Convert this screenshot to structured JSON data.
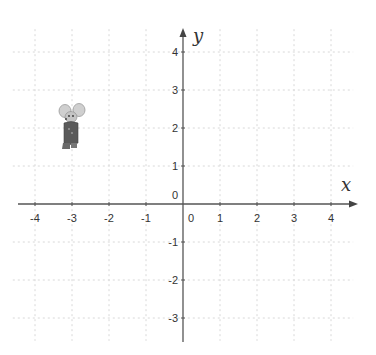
{
  "axes": {
    "x_label": "x",
    "y_label": "y",
    "origin_px": [
      183,
      204
    ],
    "unit_px_x": 37,
    "unit_px_y": 38,
    "x_ticks": [
      "-4",
      "-3",
      "-2",
      "-1",
      "0",
      "1",
      "2",
      "3",
      "4"
    ],
    "x_tick_values": [
      -4,
      -3,
      -2,
      -1,
      0,
      1,
      2,
      3,
      4
    ],
    "y_ticks": [
      "-3",
      "-2",
      "-1",
      "0",
      "1",
      "2",
      "3",
      "4"
    ],
    "y_tick_values": [
      -3,
      -2,
      -1,
      0,
      1,
      2,
      3,
      4
    ],
    "xlim": [
      -4.6,
      4.6
    ],
    "ylim": [
      -3.6,
      4.6
    ],
    "grid": true,
    "grid_style": "dotted",
    "colors": {
      "axis": "#555555",
      "grid": "#d8d8d8",
      "label": "#333333"
    }
  },
  "objects": [
    {
      "name": "mouse-figure",
      "description": "cartoon mouse",
      "position": [
        -3,
        2
      ],
      "colors": {
        "ears": "#c8c8c8",
        "body": "#555555",
        "face": "#bdbdbd"
      }
    }
  ]
}
